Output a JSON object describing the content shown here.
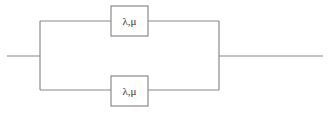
{
  "diagram": {
    "type": "parallel-redundancy-block-diagram",
    "line_color": "#8a8a8a",
    "blocks": [
      {
        "id": "top",
        "label": "λ,μ"
      },
      {
        "id": "bottom",
        "label": "λ,μ"
      }
    ]
  }
}
